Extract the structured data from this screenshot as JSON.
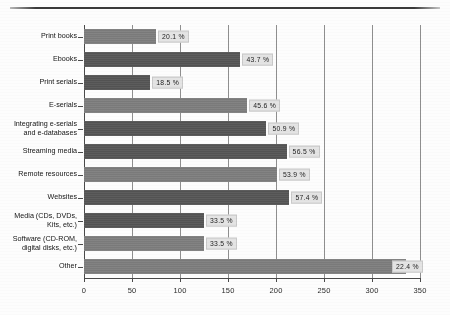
{
  "chart_data": {
    "type": "bar",
    "orientation": "horizontal",
    "title": "",
    "xlabel": "",
    "ylabel": "",
    "xlim": [
      0,
      350
    ],
    "xticks": [
      "0",
      "50",
      "100",
      "150",
      "200",
      "250",
      "300",
      "350"
    ],
    "grid": true,
    "legend": "none",
    "categories": [
      "Print books",
      "Ebooks",
      "Print serials",
      "E-serials",
      "Integrating e-serials\nand e-databases",
      "Streaming media",
      "Remote resources",
      "Websites",
      "Media (CDs, DVDs,\nKits, etc.)",
      "Software (CD-ROM,\ndigital disks, etc.)",
      "Other"
    ],
    "values": [
      75,
      163,
      69,
      170,
      190,
      211,
      201,
      214,
      125,
      125,
      335
    ],
    "data_labels": [
      "20.1 %",
      "43.7 %",
      "18.5 %",
      "45.6 %",
      "50.9 %",
      "56.5 %",
      "53.9 %",
      "57.4 %",
      "33.5 %",
      "33.5 %",
      "22.4 %"
    ],
    "bar_shades": [
      "mid",
      "dark",
      "dark",
      "mid",
      "dark",
      "dark",
      "mid",
      "dark",
      "dark",
      "mid",
      "mid"
    ],
    "colors": {
      "bar_dark": "#565656",
      "bar_mid": "#7e7e7e",
      "label_box": "#e4e4e4",
      "axis": "#4a4a4a",
      "grid": "#8f8f8f",
      "background": "#fdfdfd"
    }
  }
}
